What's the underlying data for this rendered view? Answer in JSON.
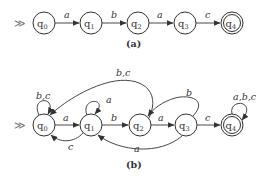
{
  "diagram_a": {
    "caption": "(a)",
    "start_marker": "≫",
    "states": [
      {
        "id": "q0",
        "base": "q",
        "sub": "0",
        "accepting": false
      },
      {
        "id": "q1",
        "base": "q",
        "sub": "1",
        "accepting": false
      },
      {
        "id": "q2",
        "base": "q",
        "sub": "2",
        "accepting": false
      },
      {
        "id": "q3",
        "base": "q",
        "sub": "3",
        "accepting": false
      },
      {
        "id": "q4",
        "base": "q",
        "sub": "4",
        "accepting": true
      }
    ],
    "transitions": [
      {
        "from": "q0",
        "to": "q1",
        "label": "a"
      },
      {
        "from": "q1",
        "to": "q2",
        "label": "b"
      },
      {
        "from": "q2",
        "to": "q3",
        "label": "a"
      },
      {
        "from": "q3",
        "to": "q4",
        "label": "c"
      }
    ]
  },
  "diagram_b": {
    "caption": "(b)",
    "start_marker": "≫",
    "states": [
      {
        "id": "q0",
        "base": "q",
        "sub": "0",
        "accepting": false
      },
      {
        "id": "q1",
        "base": "q",
        "sub": "1",
        "accepting": false
      },
      {
        "id": "q2",
        "base": "q",
        "sub": "2",
        "accepting": false
      },
      {
        "id": "q3",
        "base": "q",
        "sub": "3",
        "accepting": false
      },
      {
        "id": "q4",
        "base": "q",
        "sub": "4",
        "accepting": true
      }
    ],
    "transitions": [
      {
        "from": "q0",
        "to": "q0",
        "label": "b,c"
      },
      {
        "from": "q0",
        "to": "q1",
        "label": "a"
      },
      {
        "from": "q1",
        "to": "q1",
        "label": "a"
      },
      {
        "from": "q1",
        "to": "q0",
        "label": "c"
      },
      {
        "from": "q1",
        "to": "q2",
        "label": "b"
      },
      {
        "from": "q2",
        "to": "q0",
        "label": "b,c"
      },
      {
        "from": "q2",
        "to": "q3",
        "label": "a"
      },
      {
        "from": "q3",
        "to": "q2",
        "label": "b"
      },
      {
        "from": "q3",
        "to": "q1",
        "label": "a"
      },
      {
        "from": "q3",
        "to": "q4",
        "label": "c"
      },
      {
        "from": "q4",
        "to": "q4",
        "label": "a,b,c"
      }
    ]
  }
}
